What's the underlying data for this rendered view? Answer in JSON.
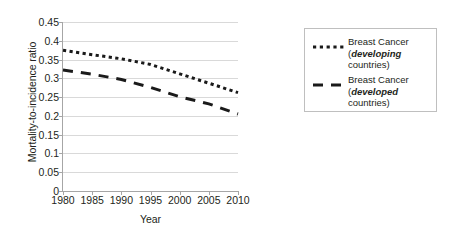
{
  "chart_data": {
    "type": "line",
    "title": "",
    "xlabel": "Year",
    "ylabel": "Mortality-to-incidence ratio",
    "xlim": [
      1980,
      2010
    ],
    "ylim": [
      0,
      0.45
    ],
    "ytick_step": 0.05,
    "grid": true,
    "legend_position": "right",
    "x": [
      1980,
      1985,
      1990,
      1995,
      2000,
      2005,
      2010
    ],
    "xticklabels": [
      "1980",
      "1985",
      "1990",
      "1995",
      "2000",
      "2005",
      "2010"
    ],
    "yticklabels": [
      "0",
      "0.05",
      "0.1",
      "0.15",
      "0.2",
      "0.25",
      "0.3",
      "0.35",
      "0.4",
      "0.45"
    ],
    "yticks": [
      0,
      0.05,
      0.1,
      0.15,
      0.2,
      0.25,
      0.3,
      0.35,
      0.4,
      0.45
    ],
    "series": [
      {
        "name": "Breast Cancer (developing countries)",
        "style": "dotted",
        "color": "#1a1a1a",
        "values": [
          0.375,
          0.363,
          0.352,
          0.337,
          0.312,
          0.287,
          0.262
        ]
      },
      {
        "name": "Breast Cancer (developed countries)",
        "style": "dashed",
        "color": "#1a1a1a",
        "values": [
          0.322,
          0.311,
          0.297,
          0.276,
          0.251,
          0.232,
          0.205
        ]
      }
    ]
  },
  "axes": {
    "y_title": "Mortality-to-incidence ratio",
    "x_title": "Year"
  },
  "legend": {
    "entries": [
      {
        "swatch": "dotted-line-swatch",
        "line1": "Breast Cancer",
        "line2_open": "(",
        "line2_emph": "developing",
        "line3": "countries)"
      },
      {
        "swatch": "dashed-line-swatch",
        "line1": "Breast Cancer",
        "line2_open": "(",
        "line2_emph": "developed",
        "line3": "countries)"
      }
    ]
  },
  "colors": {
    "series_line": "#1a1a1a",
    "gridline": "#d9d9d9",
    "axis": "#a6a6a6",
    "legend_border": "#bfbfbf",
    "text": "#231f20",
    "background": "#ffffff"
  }
}
